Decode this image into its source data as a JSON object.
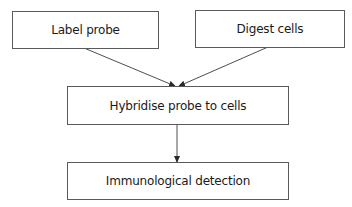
{
  "diagram": {
    "type": "flowchart",
    "nodes": [
      {
        "id": "label_probe",
        "label": "Label probe"
      },
      {
        "id": "digest_cells",
        "label": "Digest cells"
      },
      {
        "id": "hybridise",
        "label": "Hybridise probe to cells"
      },
      {
        "id": "detection",
        "label": "Immunological detection"
      }
    ],
    "edges": [
      {
        "from": "label_probe",
        "to": "hybridise"
      },
      {
        "from": "digest_cells",
        "to": "hybridise"
      },
      {
        "from": "hybridise",
        "to": "detection"
      }
    ],
    "colors": {
      "stroke": "#5a5a5a",
      "text": "#1a1a1a",
      "background": "#ffffff"
    }
  }
}
